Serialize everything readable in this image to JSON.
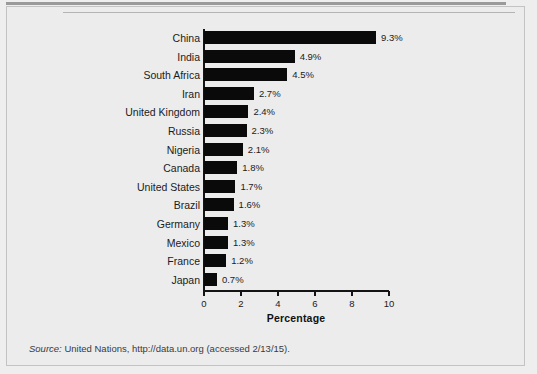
{
  "figure": {
    "source_keyword": "Source:",
    "source_text": " United Nations, http://data.un.org (accessed 2/13/15)."
  },
  "chart_data": {
    "type": "bar",
    "orientation": "horizontal",
    "title": "",
    "xlabel": "Percentage",
    "ylabel": "",
    "xlim": [
      0,
      10
    ],
    "xticks": [
      "0",
      "2",
      "4",
      "6",
      "8",
      "10"
    ],
    "grid": false,
    "legend": false,
    "bar_color": "#0a0a0a",
    "categories": [
      "China",
      "India",
      "South Africa",
      "Iran",
      "United Kingdom",
      "Russia",
      "Nigeria",
      "Canada",
      "United States",
      "Brazil",
      "Germany",
      "Mexico",
      "France",
      "Japan"
    ],
    "values": [
      9.3,
      4.9,
      4.5,
      2.7,
      2.4,
      2.3,
      2.1,
      1.8,
      1.7,
      1.6,
      1.3,
      1.3,
      1.2,
      0.7
    ],
    "value_labels": [
      "9.3%",
      "4.9%",
      "4.5%",
      "2.7%",
      "2.4%",
      "2.3%",
      "2.1%",
      "1.8%",
      "1.7%",
      "1.6%",
      "1.3%",
      "1.3%",
      "1.2%",
      "0.7%"
    ]
  }
}
